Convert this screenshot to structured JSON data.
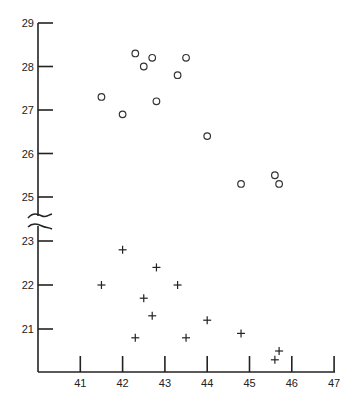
{
  "chart_data": {
    "type": "scatter",
    "title": "",
    "xlabel": "",
    "ylabel": "",
    "xlim": [
      40,
      47
    ],
    "ylim_upper": [
      25,
      29
    ],
    "ylim_lower": [
      20.2,
      23
    ],
    "y_axis_break": true,
    "grid": false,
    "legend": null,
    "x_ticks": [
      41,
      42,
      43,
      44,
      45,
      46,
      47
    ],
    "y_ticks": [
      21,
      22,
      23,
      25,
      26,
      27,
      28,
      29
    ],
    "series": [
      {
        "name": "circles",
        "marker": "open-circle",
        "points": [
          {
            "x": 41.5,
            "y": 27.3
          },
          {
            "x": 42.0,
            "y": 26.9
          },
          {
            "x": 42.3,
            "y": 28.3
          },
          {
            "x": 42.5,
            "y": 28.0
          },
          {
            "x": 42.7,
            "y": 28.2
          },
          {
            "x": 42.8,
            "y": 27.2
          },
          {
            "x": 43.3,
            "y": 27.8
          },
          {
            "x": 43.5,
            "y": 28.2
          },
          {
            "x": 44.0,
            "y": 26.4
          },
          {
            "x": 44.8,
            "y": 25.3
          },
          {
            "x": 45.6,
            "y": 25.5
          },
          {
            "x": 45.7,
            "y": 25.3
          }
        ]
      },
      {
        "name": "crosses",
        "marker": "plus",
        "points": [
          {
            "x": 41.5,
            "y": 22.0
          },
          {
            "x": 42.0,
            "y": 22.8
          },
          {
            "x": 42.3,
            "y": 20.8
          },
          {
            "x": 42.5,
            "y": 21.7
          },
          {
            "x": 42.7,
            "y": 21.3
          },
          {
            "x": 42.8,
            "y": 22.4
          },
          {
            "x": 43.3,
            "y": 22.0
          },
          {
            "x": 43.5,
            "y": 20.8
          },
          {
            "x": 44.0,
            "y": 21.2
          },
          {
            "x": 44.8,
            "y": 20.9
          },
          {
            "x": 45.6,
            "y": 20.3
          },
          {
            "x": 45.7,
            "y": 20.5
          }
        ]
      }
    ]
  }
}
